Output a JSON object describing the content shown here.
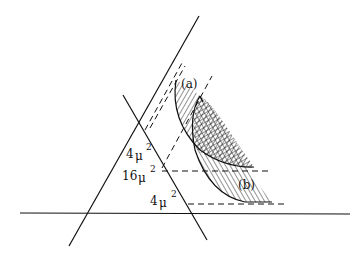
{
  "diagram": {
    "labels": {
      "region_a": "(a)",
      "region_b": "(b)",
      "upper_left": "4",
      "upper_left_mu": "μ",
      "upper_left_exp": "2",
      "middle": "16",
      "middle_mu": "μ",
      "middle_exp": "2",
      "lower": "4",
      "lower_mu": "μ",
      "lower_exp": "2"
    },
    "colors": {
      "ink": "#111111",
      "background": "#ffffff"
    }
  }
}
